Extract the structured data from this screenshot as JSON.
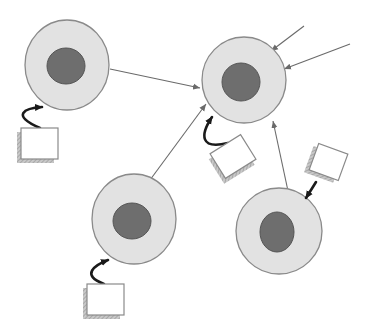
{
  "diagram": {
    "title": "",
    "colors": {
      "background": "#ffffff",
      "cytoplasm": "#e2e2e2",
      "cell_border": "#8a8a8a",
      "nucleus": "#6e6e6e",
      "nucleus_border": "#555555",
      "arrow": "#6a6a6a",
      "curved_arrow": "#1a1a1a",
      "box_fill": "#ffffff",
      "box_border": "#8a8a8a",
      "box_shadow": "#a8a8a8"
    },
    "cells": [
      {
        "id": "cell-top-left",
        "cx": 67,
        "cy": 65,
        "rx": 42,
        "ry": 45,
        "nucleus": {
          "cx": 66,
          "cy": 66,
          "rx": 19,
          "ry": 18
        }
      },
      {
        "id": "cell-hub",
        "cx": 244,
        "cy": 80,
        "rx": 42,
        "ry": 43,
        "nucleus": {
          "cx": 241,
          "cy": 82,
          "rx": 19,
          "ry": 19
        }
      },
      {
        "id": "cell-bottom-left",
        "cx": 134,
        "cy": 219,
        "rx": 42,
        "ry": 45,
        "nucleus": {
          "cx": 132,
          "cy": 221,
          "rx": 19,
          "ry": 18
        }
      },
      {
        "id": "cell-bottom-right",
        "cx": 279,
        "cy": 231,
        "rx": 43,
        "ry": 43,
        "nucleus": {
          "cx": 277,
          "cy": 232,
          "rx": 17,
          "ry": 20
        }
      }
    ],
    "signal_arrows": [
      {
        "id": "arrow-topleft-to-hub",
        "x1": 110,
        "y1": 69,
        "x2": 200,
        "y2": 88
      },
      {
        "id": "arrow-bottomleft-to-hub",
        "x1": 150,
        "y1": 180,
        "x2": 206,
        "y2": 104
      },
      {
        "id": "arrow-bottomright-to-hub",
        "x1": 288,
        "y1": 191,
        "x2": 273,
        "y2": 121
      },
      {
        "id": "arrow-external-1-to-hub",
        "x1": 304,
        "y1": 26,
        "x2": 271,
        "y2": 51
      },
      {
        "id": "arrow-external-2-to-hub",
        "x1": 350,
        "y1": 44,
        "x2": 284,
        "y2": 69
      }
    ],
    "signal_boxes": [
      {
        "id": "box-top-left",
        "x": 21,
        "y": 128,
        "w": 37,
        "h": 31,
        "rotate": 0,
        "curve": "M 40 128 C 10 115, 25 108, 42 107"
      },
      {
        "id": "box-hub",
        "x": 215,
        "y": 142,
        "w": 36,
        "h": 29,
        "rotate": -32,
        "curve": "M 228 143 C 200 150, 200 135, 212 117"
      },
      {
        "id": "box-bottom-left",
        "x": 87,
        "y": 284,
        "w": 37,
        "h": 31,
        "rotate": 0,
        "curve": "M 104 284 C 80 275, 95 265, 108 260"
      },
      {
        "id": "box-bottom-right",
        "x": 313,
        "y": 148,
        "w": 31,
        "h": 28,
        "rotate": 20,
        "curve": "M 316 182 L 306 198"
      }
    ]
  }
}
